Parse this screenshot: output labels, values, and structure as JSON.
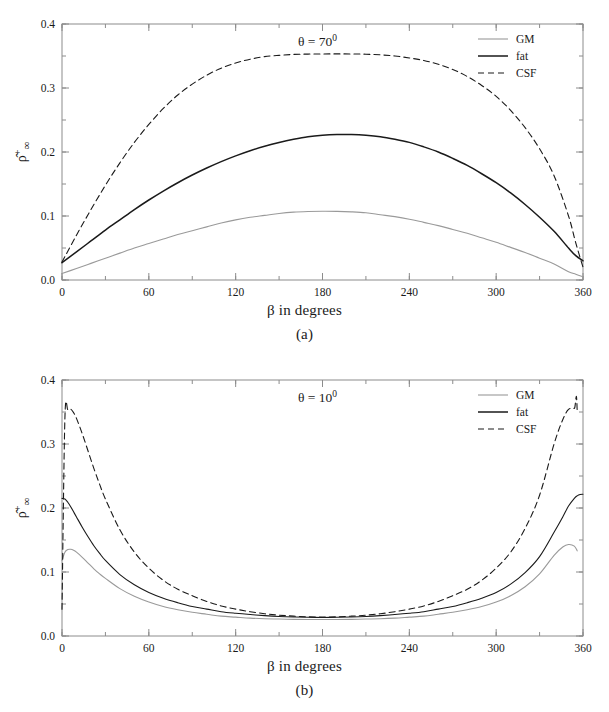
{
  "figure": {
    "panels": [
      {
        "id": "a",
        "subcaption": "(a)",
        "annotation": "θ = 70",
        "annotation_sup": "0",
        "xlabel": "β in degrees",
        "ylabel_main": "ρ",
        "ylabel_sup": "+",
        "ylabel_sub": "∞"
      },
      {
        "id": "b",
        "subcaption": "(b)",
        "annotation": "θ = 10",
        "annotation_sup": "0",
        "xlabel": "β in degrees",
        "ylabel_main": "ρ",
        "ylabel_sup": "+",
        "ylabel_sub": "∞"
      }
    ]
  },
  "colors": {
    "gm": "#9a9a9a",
    "fat": "#1a1a1a",
    "csf": "#1a1a1a",
    "axis": "#8c8c8c",
    "text": "#1a1a1a",
    "background": "#ffffff"
  },
  "chart_data": [
    {
      "type": "line",
      "title": "θ = 70⁰",
      "xlabel": "β in degrees",
      "ylabel": "ρ̂⁺₊∞",
      "xlim": [
        0,
        360
      ],
      "ylim": [
        0,
        0.4
      ],
      "xticks": [
        0,
        60,
        120,
        180,
        240,
        300,
        360
      ],
      "xticklabels": [
        "0",
        "60",
        "120",
        "180",
        "240",
        "300",
        "360"
      ],
      "yticks": [
        0.0,
        0.1,
        0.2,
        0.3,
        0.4
      ],
      "yticklabels": [
        "0.0",
        "0.1",
        "0.2",
        "0.3",
        "0.4"
      ],
      "minor_xtick_step": 30,
      "minor_ytick_step": 0.05,
      "grid": false,
      "legend_position": "top-right",
      "x": [
        0,
        10,
        20,
        30,
        40,
        50,
        60,
        70,
        80,
        90,
        100,
        110,
        120,
        130,
        140,
        150,
        160,
        170,
        180,
        190,
        200,
        210,
        220,
        230,
        240,
        250,
        260,
        270,
        280,
        290,
        300,
        310,
        320,
        330,
        340,
        350,
        355,
        360
      ],
      "series": [
        {
          "name": "GM",
          "style": "solid-thin",
          "color": "#9a9a9a",
          "values": [
            0.01,
            0.018,
            0.026,
            0.034,
            0.042,
            0.05,
            0.057,
            0.064,
            0.071,
            0.077,
            0.083,
            0.089,
            0.094,
            0.098,
            0.101,
            0.104,
            0.106,
            0.107,
            0.1075,
            0.1073,
            0.1065,
            0.105,
            0.102,
            0.099,
            0.095,
            0.09,
            0.085,
            0.079,
            0.073,
            0.066,
            0.059,
            0.051,
            0.043,
            0.034,
            0.025,
            0.013,
            0.009,
            0.005
          ]
        },
        {
          "name": "fat",
          "style": "solid-thick",
          "color": "#1a1a1a",
          "values": [
            0.027,
            0.044,
            0.061,
            0.078,
            0.094,
            0.11,
            0.125,
            0.139,
            0.152,
            0.164,
            0.175,
            0.185,
            0.194,
            0.202,
            0.209,
            0.215,
            0.22,
            0.224,
            0.2262,
            0.2272,
            0.2272,
            0.2262,
            0.224,
            0.22,
            0.215,
            0.208,
            0.2,
            0.19,
            0.179,
            0.166,
            0.152,
            0.136,
            0.118,
            0.098,
            0.076,
            0.05,
            0.038,
            0.03
          ]
        },
        {
          "name": "CSF",
          "style": "dashed",
          "color": "#1a1a1a",
          "values": [
            0.028,
            0.07,
            0.11,
            0.148,
            0.183,
            0.215,
            0.243,
            0.268,
            0.289,
            0.306,
            0.32,
            0.331,
            0.339,
            0.345,
            0.349,
            0.351,
            0.3525,
            0.353,
            0.3532,
            0.3533,
            0.3532,
            0.3528,
            0.3518,
            0.35,
            0.347,
            0.343,
            0.337,
            0.329,
            0.318,
            0.304,
            0.287,
            0.265,
            0.238,
            0.205,
            0.163,
            0.1,
            0.058,
            0.02
          ]
        }
      ]
    },
    {
      "type": "line",
      "title": "θ = 10⁰",
      "xlabel": "β in degrees",
      "ylabel": "ρ̂⁺₊∞",
      "xlim": [
        0,
        360
      ],
      "ylim": [
        0,
        0.4
      ],
      "xticks": [
        0,
        60,
        120,
        180,
        240,
        300,
        360
      ],
      "xticklabels": [
        "0",
        "60",
        "120",
        "180",
        "240",
        "300",
        "360"
      ],
      "yticks": [
        0.0,
        0.1,
        0.2,
        0.3,
        0.4
      ],
      "yticklabels": [
        "0.0",
        "0.1",
        "0.2",
        "0.3",
        "0.4"
      ],
      "minor_xtick_step": 30,
      "minor_ytick_step": 0.05,
      "grid": false,
      "legend_position": "top-right",
      "x": [
        0,
        2,
        4,
        6,
        8,
        10,
        14,
        18,
        22,
        26,
        30,
        40,
        50,
        60,
        70,
        80,
        90,
        100,
        110,
        120,
        130,
        140,
        150,
        160,
        170,
        180,
        190,
        200,
        210,
        220,
        230,
        240,
        250,
        260,
        270,
        280,
        290,
        300,
        310,
        320,
        330,
        340,
        346,
        350,
        354,
        356,
        358,
        360
      ],
      "series": [
        {
          "name": "GM",
          "style": "solid-thin",
          "color": "#9a9a9a",
          "values": [
            0.118,
            0.131,
            0.135,
            0.1355,
            0.134,
            0.131,
            0.123,
            0.114,
            0.105,
            0.097,
            0.09,
            0.074,
            0.062,
            0.053,
            0.046,
            0.041,
            0.037,
            0.034,
            0.031,
            0.0295,
            0.028,
            0.027,
            0.0265,
            0.026,
            0.0258,
            0.0257,
            0.0258,
            0.026,
            0.0265,
            0.027,
            0.028,
            0.0295,
            0.031,
            0.034,
            0.037,
            0.041,
            0.046,
            0.053,
            0.063,
            0.077,
            0.097,
            0.126,
            0.139,
            0.143,
            0.1405,
            0.133,
            0.122
          ]
        },
        {
          "name": "fat",
          "style": "solid-thin-black",
          "color": "#1a1a1a",
          "values": [
            0.215,
            0.214,
            0.209,
            0.202,
            0.194,
            0.186,
            0.17,
            0.155,
            0.141,
            0.129,
            0.118,
            0.096,
            0.08,
            0.068,
            0.059,
            0.052,
            0.046,
            0.042,
            0.038,
            0.0355,
            0.0335,
            0.0318,
            0.0305,
            0.0297,
            0.0292,
            0.029,
            0.0292,
            0.0297,
            0.0305,
            0.0318,
            0.0335,
            0.0355,
            0.038,
            0.042,
            0.046,
            0.052,
            0.059,
            0.068,
            0.081,
            0.099,
            0.124,
            0.162,
            0.186,
            0.203,
            0.215,
            0.219,
            0.221,
            0.2215
          ]
        },
        {
          "name": "CSF",
          "style": "dashed",
          "color": "#1a1a1a",
          "values": [
            0.042,
            0.34,
            0.354,
            0.3545,
            0.349,
            0.34,
            0.316,
            0.289,
            0.262,
            0.237,
            0.214,
            0.166,
            0.131,
            0.106,
            0.087,
            0.073,
            0.063,
            0.054,
            0.047,
            0.042,
            0.038,
            0.0348,
            0.0325,
            0.031,
            0.03,
            0.0297,
            0.03,
            0.031,
            0.0325,
            0.0348,
            0.038,
            0.042,
            0.047,
            0.054,
            0.063,
            0.073,
            0.087,
            0.106,
            0.131,
            0.168,
            0.22,
            0.3,
            0.338,
            0.354,
            0.3555,
            0.35,
            0.045
          ]
        }
      ]
    }
  ],
  "legend": {
    "entries": [
      {
        "label": "GM",
        "style": "solid-thin",
        "color": "#9a9a9a"
      },
      {
        "label": "fat",
        "style": "solid-thick",
        "color": "#1a1a1a"
      },
      {
        "label": "CSF",
        "style": "dashed",
        "color": "#1a1a1a"
      }
    ]
  }
}
